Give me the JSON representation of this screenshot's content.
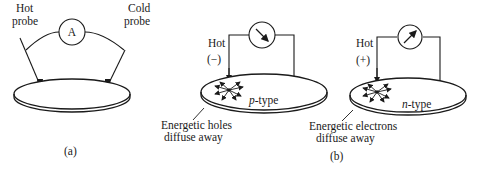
{
  "figure_a": {
    "hot_probe_label": [
      "Hot",
      "probe"
    ],
    "cold_probe_label": [
      "Cold",
      "probe"
    ],
    "meter_symbol": "A",
    "caption": "(a)"
  },
  "figure_b_left": {
    "hot_label": "Hot",
    "polarity": "(−)",
    "material": "p-type",
    "material_italic": "p",
    "material_suffix": "-type",
    "annotation": [
      "Energetic holes",
      "diffuse away"
    ]
  },
  "figure_b_right": {
    "hot_label": "Hot",
    "polarity": "(+)",
    "material": "n-type",
    "material_italic": "n",
    "material_suffix": "-type",
    "annotation": [
      "Energetic electrons",
      "diffuse away"
    ]
  },
  "figure_b_caption": "(b)",
  "colors": {
    "ink": "#1a1a1a",
    "background": "#ffffff"
  }
}
